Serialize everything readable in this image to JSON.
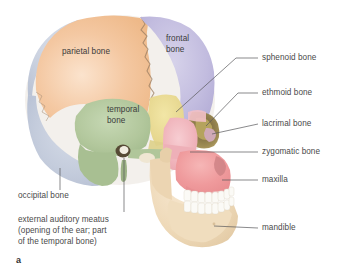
{
  "figure": {
    "letter": "a",
    "background_color": "#ffffff",
    "text_color": "#4a4a4a",
    "leader_line_color": "#58585a"
  },
  "bone_labels_on_figure": [
    {
      "id": "parietal",
      "text": "parietal bone",
      "lines": [
        "parietal bone"
      ],
      "color": "#f2c49b",
      "x": 62,
      "y": 52
    },
    {
      "id": "frontal",
      "text": "frontal bone",
      "lines": [
        "frontal",
        "bone"
      ],
      "color": "#bdb8dd",
      "x": 166,
      "y": 39
    },
    {
      "id": "temporal",
      "text": "temporal bone",
      "lines": [
        "temporal",
        "bone"
      ],
      "color": "#aec49a",
      "x": 107,
      "y": 108
    }
  ],
  "callouts_right": [
    {
      "id": "sphenoid",
      "text": "sphenoid bone",
      "x": 262,
      "y": 58,
      "color": "#e8d98a"
    },
    {
      "id": "ethmoid",
      "text": "ethmoid bone",
      "x": 262,
      "y": 93,
      "color": "#c9bf78"
    },
    {
      "id": "lacrimal",
      "text": "lacrimal bone",
      "x": 262,
      "y": 124,
      "color": "#d9b6c4"
    },
    {
      "id": "zygomatic",
      "text": "zygomatic bone",
      "x": 262,
      "y": 152,
      "color": "#f0b9bf"
    },
    {
      "id": "maxilla",
      "text": "maxilla",
      "x": 262,
      "y": 180,
      "color": "#ef9a9f"
    },
    {
      "id": "mandible",
      "text": "mandible",
      "x": 262,
      "y": 228,
      "color": "#efd9b8"
    }
  ],
  "callouts_left": [
    {
      "id": "occipital",
      "lines": [
        "occipital bone"
      ],
      "x": 18,
      "y": 196,
      "color": "#c3cbdb"
    },
    {
      "id": "external-auditory-meatus",
      "lines": [
        "external auditory meatus",
        "(opening of the ear; part",
        "of the temporal bone)"
      ],
      "x": 18,
      "y": 218
    }
  ]
}
